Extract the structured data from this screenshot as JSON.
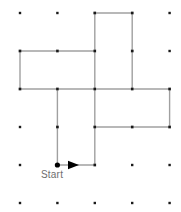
{
  "figure": {
    "width": 181,
    "height": 212,
    "background_color": "#ffffff"
  },
  "labels": {
    "start": "Start"
  },
  "label_positions": {
    "start": {
      "x": 41,
      "y": 170
    }
  },
  "grid": {
    "dot_color": "#1a1a1a",
    "dot_size": 2.4,
    "columns_x": [
      20,
      57.4,
      94.8,
      132.2,
      169.6
    ],
    "rows_y": [
      13,
      51,
      89,
      127,
      165,
      203
    ],
    "cols": 5,
    "rows": 6
  },
  "path": {
    "stroke_color": "#a0a0a0",
    "stroke_width": 1.4,
    "vertex_color": "#8a8a8a",
    "vertex_size": 2.8,
    "points": [
      {
        "x": 57.4,
        "y": 165
      },
      {
        "x": 94.8,
        "y": 165
      },
      {
        "x": 94.8,
        "y": 127
      },
      {
        "x": 169.6,
        "y": 127
      },
      {
        "x": 169.6,
        "y": 89
      },
      {
        "x": 94.8,
        "y": 89
      },
      {
        "x": 20,
        "y": 89
      },
      {
        "x": 20,
        "y": 51
      },
      {
        "x": 94.8,
        "y": 51
      },
      {
        "x": 94.8,
        "y": 13
      },
      {
        "x": 132.2,
        "y": 13
      },
      {
        "x": 132.2,
        "y": 89
      },
      {
        "x": 94.8,
        "y": 89
      },
      {
        "x": 94.8,
        "y": 165
      },
      {
        "x": 57.4,
        "y": 165
      },
      {
        "x": 57.4,
        "y": 89
      }
    ],
    "vertices": [
      {
        "x": 94.8,
        "y": 13
      },
      {
        "x": 132.2,
        "y": 13
      },
      {
        "x": 20,
        "y": 51
      },
      {
        "x": 57.4,
        "y": 51
      },
      {
        "x": 94.8,
        "y": 51
      },
      {
        "x": 132.2,
        "y": 51
      },
      {
        "x": 20,
        "y": 89
      },
      {
        "x": 57.4,
        "y": 89
      },
      {
        "x": 94.8,
        "y": 89
      },
      {
        "x": 132.2,
        "y": 89
      },
      {
        "x": 169.6,
        "y": 89
      },
      {
        "x": 57.4,
        "y": 127
      },
      {
        "x": 94.8,
        "y": 127
      },
      {
        "x": 132.2,
        "y": 127
      },
      {
        "x": 169.6,
        "y": 127
      },
      {
        "x": 94.8,
        "y": 165
      }
    ],
    "segments": [
      {
        "x1": 94.8,
        "y1": 13,
        "x2": 132.2,
        "y2": 13
      },
      {
        "x1": 94.8,
        "y1": 13,
        "x2": 94.8,
        "y2": 165
      },
      {
        "x1": 132.2,
        "y1": 13,
        "x2": 132.2,
        "y2": 89
      },
      {
        "x1": 20,
        "y1": 51,
        "x2": 94.8,
        "y2": 51
      },
      {
        "x1": 20,
        "y1": 51,
        "x2": 20,
        "y2": 89
      },
      {
        "x1": 20,
        "y1": 89,
        "x2": 169.6,
        "y2": 89
      },
      {
        "x1": 169.6,
        "y1": 89,
        "x2": 169.6,
        "y2": 127
      },
      {
        "x1": 94.8,
        "y1": 127,
        "x2": 169.6,
        "y2": 127
      },
      {
        "x1": 57.4,
        "y1": 89,
        "x2": 57.4,
        "y2": 165
      },
      {
        "x1": 57.4,
        "y1": 165,
        "x2": 94.8,
        "y2": 165
      }
    ]
  },
  "start_marker": {
    "dot": {
      "x": 57.4,
      "y": 165,
      "radius": 2.6,
      "color": "#000000"
    },
    "arrow": {
      "tip_x": 79,
      "tip_y": 165,
      "tail_x": 68,
      "half_height": 4.2,
      "color": "#000000"
    }
  }
}
